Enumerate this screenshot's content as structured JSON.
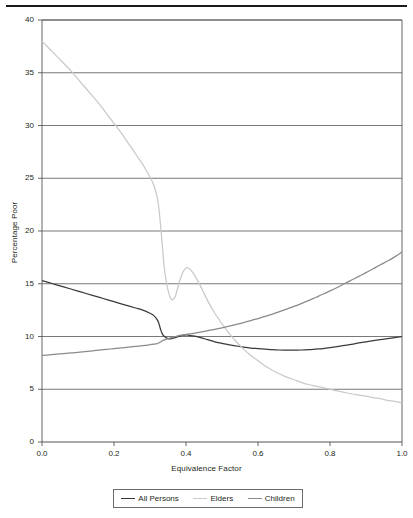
{
  "figure": {
    "has_top_rule": true
  },
  "axes": {
    "ylabel": "Percentage Poor",
    "xlabel": "Equivalence Factor",
    "yticks": [
      "0",
      "5",
      "10",
      "15",
      "20",
      "25",
      "30",
      "35",
      "40"
    ],
    "xticks": [
      "0.0",
      "0.2",
      "0.4",
      "0.6",
      "0.8",
      "1.0"
    ]
  },
  "legend": {
    "items": [
      {
        "label": "All Persons",
        "color": "#3a3a3a"
      },
      {
        "label": "Elders",
        "color": "#c9c9c9"
      },
      {
        "label": "Children",
        "color": "#8a8a8a"
      }
    ]
  },
  "chart_data": {
    "type": "line",
    "title": "",
    "xlabel": "Equivalence Factor",
    "ylabel": "Percentage Poor",
    "xlim": [
      0.0,
      1.0
    ],
    "ylim": [
      0,
      40
    ],
    "grid": true,
    "grid_axis": "y",
    "legend_position": "below",
    "x": [
      0.0,
      0.02,
      0.04,
      0.06,
      0.08,
      0.1,
      0.12,
      0.14,
      0.16,
      0.18,
      0.2,
      0.22,
      0.24,
      0.26,
      0.28,
      0.3,
      0.31,
      0.32,
      0.325,
      0.33,
      0.335,
      0.34,
      0.35,
      0.36,
      0.37,
      0.38,
      0.39,
      0.4,
      0.41,
      0.42,
      0.44,
      0.46,
      0.48,
      0.5,
      0.52,
      0.54,
      0.56,
      0.58,
      0.6,
      0.62,
      0.64,
      0.66,
      0.68,
      0.7,
      0.72,
      0.74,
      0.76,
      0.78,
      0.8,
      0.82,
      0.84,
      0.86,
      0.88,
      0.9,
      0.92,
      0.94,
      0.96,
      0.98,
      1.0
    ],
    "series": [
      {
        "name": "All Persons",
        "color": "#3a3a3a",
        "values": [
          15.3,
          15.1,
          14.9,
          14.7,
          14.5,
          14.3,
          14.1,
          13.9,
          13.7,
          13.5,
          13.3,
          13.1,
          12.9,
          12.7,
          12.5,
          12.2,
          12.0,
          11.6,
          11.2,
          10.6,
          10.2,
          10.0,
          9.8,
          9.8,
          9.9,
          10.0,
          10.1,
          10.15,
          10.1,
          10.05,
          9.9,
          9.7,
          9.5,
          9.35,
          9.2,
          9.1,
          9.0,
          8.9,
          8.85,
          8.8,
          8.75,
          8.72,
          8.7,
          8.7,
          8.72,
          8.75,
          8.8,
          8.85,
          8.95,
          9.05,
          9.15,
          9.25,
          9.4,
          9.5,
          9.6,
          9.7,
          9.8,
          9.9,
          10.0
        ]
      },
      {
        "name": "Elders",
        "color": "#c9c9c9",
        "values": [
          38.0,
          37.3,
          36.6,
          35.9,
          35.2,
          34.4,
          33.6,
          32.8,
          32.0,
          31.1,
          30.2,
          29.3,
          28.3,
          27.3,
          26.3,
          25.1,
          24.4,
          23.2,
          22.0,
          20.3,
          18.3,
          16.4,
          14.4,
          13.5,
          13.8,
          15.0,
          16.0,
          16.5,
          16.4,
          16.0,
          14.8,
          13.4,
          12.2,
          11.2,
          10.3,
          9.5,
          8.8,
          8.2,
          7.7,
          7.2,
          6.8,
          6.45,
          6.15,
          5.9,
          5.65,
          5.45,
          5.3,
          5.15,
          5.0,
          4.85,
          4.7,
          4.55,
          4.45,
          4.35,
          4.2,
          4.1,
          3.95,
          3.85,
          3.7
        ]
      },
      {
        "name": "Children",
        "color": "#8a8a8a",
        "values": [
          8.2,
          8.26,
          8.32,
          8.38,
          8.44,
          8.5,
          8.57,
          8.64,
          8.71,
          8.78,
          8.85,
          8.92,
          8.99,
          9.06,
          9.13,
          9.22,
          9.27,
          9.33,
          9.4,
          9.5,
          9.6,
          9.68,
          9.8,
          9.9,
          10.0,
          10.08,
          10.14,
          10.2,
          10.24,
          10.3,
          10.42,
          10.55,
          10.68,
          10.82,
          10.98,
          11.15,
          11.32,
          11.5,
          11.7,
          11.9,
          12.12,
          12.35,
          12.6,
          12.85,
          13.12,
          13.4,
          13.7,
          14.0,
          14.32,
          14.65,
          15.0,
          15.35,
          15.7,
          16.05,
          16.42,
          16.8,
          17.15,
          17.55,
          18.0
        ]
      }
    ]
  }
}
